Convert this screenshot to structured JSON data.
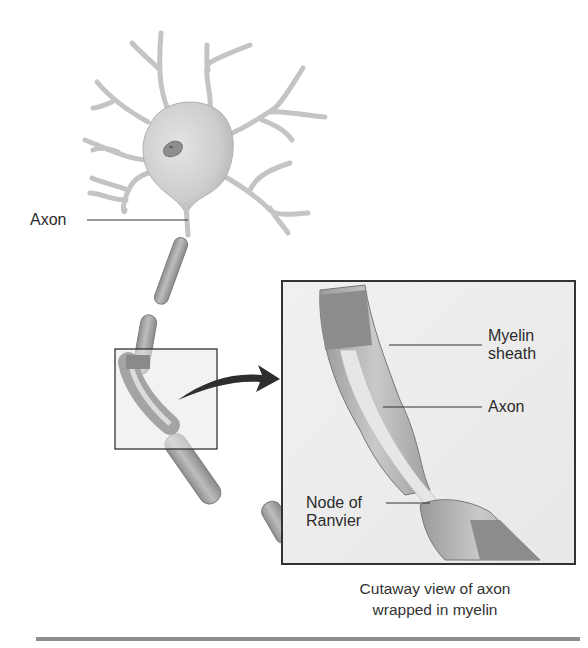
{
  "figure": {
    "labels": {
      "axon_main": "Axon",
      "myelin_line1": "Myelin",
      "myelin_line2": "sheath",
      "axon_inset": "Axon",
      "node_line1": "Node of",
      "node_line2": "Ranvier"
    },
    "caption": {
      "line1": "Cutaway view of axon",
      "line2": "wrapped in myelin"
    },
    "colors": {
      "background": "#ffffff",
      "cell_body": "#cfcfcf",
      "nucleus": "#8a8a8a",
      "myelin": "#a9a9a9",
      "myelin_dark": "#7d7d7d",
      "axon_core": "#e6e6e6",
      "inset_bg": "#ececec",
      "line": "#333333",
      "arrow": "#2e2e2e",
      "rule": "#8d8d8d"
    }
  }
}
